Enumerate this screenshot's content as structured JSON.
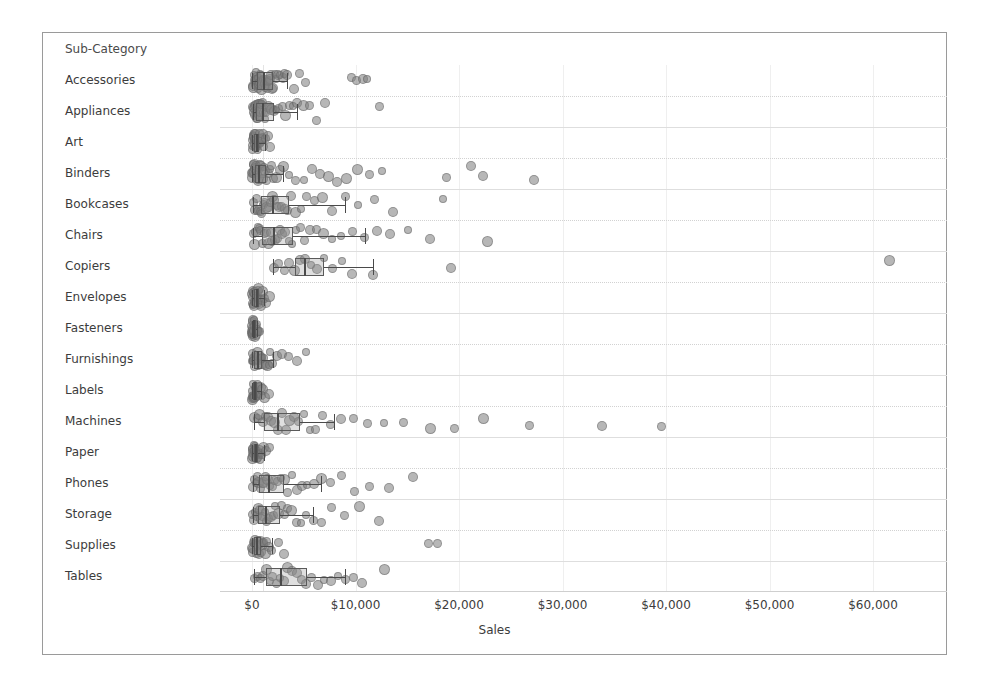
{
  "header": {
    "field_caption": "Sub-Category"
  },
  "axis": {
    "title": "Sales",
    "tick_labels": [
      "$0",
      "$10,000",
      "$20,000",
      "$30,000",
      "$40,000",
      "$50,000",
      "$60,000"
    ],
    "tick_values": [
      0,
      10000,
      20000,
      30000,
      40000,
      50000,
      60000
    ]
  },
  "style": {
    "mark_color": "#7c7c7c",
    "box_line_color": "#4a4a4a",
    "gridline_color": "#dedede",
    "border_color": "#9a9a9a",
    "text_color": "#3c3c3c"
  },
  "chart_data": {
    "type": "box",
    "title": "",
    "xlabel": "Sales",
    "ylabel": "Sub-Category",
    "xlim": [
      -2000,
      65000
    ],
    "grid": true,
    "legend": "none",
    "orientation": "horizontal",
    "categories": [
      "Accessories",
      "Appliances",
      "Art",
      "Binders",
      "Bookcases",
      "Chairs",
      "Copiers",
      "Envelopes",
      "Fasteners",
      "Furnishings",
      "Labels",
      "Machines",
      "Paper",
      "Phones",
      "Storage",
      "Supplies",
      "Tables"
    ],
    "series": [
      {
        "name": "Accessories",
        "min": 40,
        "q1": 480,
        "median": 1100,
        "q3": 2050,
        "max": 3400,
        "points": [
          120,
          180,
          220,
          260,
          300,
          340,
          380,
          420,
          470,
          520,
          560,
          600,
          650,
          700,
          760,
          820,
          880,
          940,
          1000,
          1080,
          1150,
          1220,
          1300,
          1380,
          1450,
          1550,
          1650,
          1750,
          1850,
          1950,
          2050,
          2200,
          2350,
          2500,
          2700,
          2950,
          3150,
          3400,
          4100,
          4600,
          5200,
          9600,
          10100,
          10700,
          11100
        ]
      },
      {
        "name": "Appliances",
        "min": 60,
        "q1": 420,
        "median": 1000,
        "q3": 2100,
        "max": 4300,
        "points": [
          90,
          150,
          200,
          250,
          300,
          350,
          400,
          450,
          520,
          580,
          640,
          700,
          780,
          860,
          940,
          1020,
          1120,
          1220,
          1340,
          1460,
          1600,
          1760,
          1900,
          2100,
          2350,
          2600,
          2900,
          3200,
          3600,
          4000,
          4300,
          5000,
          5600,
          6200,
          7100,
          12300
        ]
      },
      {
        "name": "Art",
        "min": 20,
        "q1": 190,
        "median": 380,
        "q3": 700,
        "max": 1300,
        "points": [
          30,
          55,
          80,
          110,
          140,
          170,
          200,
          230,
          260,
          300,
          340,
          380,
          420,
          460,
          510,
          560,
          620,
          680,
          740,
          810,
          890,
          970,
          1060,
          1150,
          1300,
          1500,
          1750
        ]
      },
      {
        "name": "Binders",
        "min": 30,
        "q1": 280,
        "median": 620,
        "q3": 1400,
        "max": 3000,
        "points": [
          40,
          80,
          130,
          180,
          230,
          280,
          330,
          390,
          450,
          510,
          580,
          650,
          720,
          800,
          880,
          970,
          1060,
          1160,
          1270,
          1400,
          1550,
          1700,
          1900,
          2100,
          2400,
          2700,
          3000,
          3600,
          4200,
          5000,
          5800,
          6600,
          7400,
          8200,
          9100,
          10200,
          11400,
          12600,
          18800,
          21200,
          22300,
          27200
        ]
      },
      {
        "name": "Bookcases",
        "min": 120,
        "q1": 900,
        "median": 1900,
        "q3": 3600,
        "max": 9000,
        "points": [
          150,
          280,
          400,
          520,
          650,
          790,
          930,
          1080,
          1230,
          1400,
          1570,
          1750,
          1950,
          2150,
          2380,
          2620,
          2880,
          3150,
          3450,
          3800,
          4200,
          4700,
          5300,
          6000,
          6800,
          7700,
          9000,
          10200,
          11800,
          13600,
          18500
        ]
      },
      {
        "name": "Chairs",
        "min": 100,
        "q1": 950,
        "median": 2000,
        "q3": 4000,
        "max": 10900,
        "points": [
          130,
          260,
          400,
          550,
          700,
          860,
          1020,
          1190,
          1370,
          1560,
          1760,
          1970,
          2190,
          2420,
          2670,
          2940,
          3230,
          3540,
          3880,
          4250,
          4660,
          5100,
          5600,
          6200,
          6900,
          7700,
          8600,
          9700,
          10900,
          12100,
          13300,
          15100,
          17200,
          22800
        ]
      },
      {
        "name": "Copiers",
        "min": 2000,
        "q1": 4200,
        "median": 5000,
        "q3": 7000,
        "max": 11700,
        "points": [
          2100,
          2600,
          3100,
          3600,
          4100,
          4600,
          5100,
          5700,
          6300,
          7000,
          7800,
          8700,
          9700,
          11700,
          19200,
          61600
        ]
      },
      {
        "name": "Envelopes",
        "min": 20,
        "q1": 170,
        "median": 340,
        "q3": 640,
        "max": 1200,
        "points": [
          25,
          50,
          80,
          110,
          140,
          175,
          210,
          250,
          290,
          330,
          375,
          420,
          470,
          520,
          580,
          640,
          710,
          780,
          860,
          950,
          1050,
          1200,
          1400,
          1650
        ]
      },
      {
        "name": "Fasteners",
        "min": 10,
        "q1": 60,
        "median": 130,
        "q3": 260,
        "max": 520,
        "points": [
          12,
          25,
          40,
          55,
          70,
          90,
          110,
          130,
          155,
          180,
          210,
          240,
          275,
          310,
          350,
          400,
          450,
          520,
          620,
          760
        ]
      },
      {
        "name": "Furnishings",
        "min": 20,
        "q1": 220,
        "median": 470,
        "q3": 950,
        "max": 2000,
        "points": [
          30,
          70,
          110,
          160,
          210,
          260,
          320,
          380,
          440,
          500,
          570,
          640,
          720,
          800,
          890,
          980,
          1080,
          1190,
          1310,
          1450,
          1600,
          1780,
          2000,
          2400,
          2900,
          3500,
          4300,
          5200
        ]
      },
      {
        "name": "Labels",
        "min": 10,
        "q1": 110,
        "median": 230,
        "q3": 450,
        "max": 900,
        "points": [
          15,
          35,
          55,
          80,
          105,
          130,
          160,
          190,
          225,
          260,
          300,
          345,
          390,
          440,
          500,
          560,
          630,
          710,
          800,
          900,
          1050,
          1250,
          1600
        ]
      },
      {
        "name": "Machines",
        "min": 200,
        "q1": 1200,
        "median": 2400,
        "q3": 4600,
        "max": 7900,
        "points": [
          250,
          500,
          760,
          1020,
          1300,
          1580,
          1880,
          2190,
          2520,
          2870,
          3240,
          3640,
          4070,
          4530,
          5030,
          5570,
          6170,
          6840,
          7600,
          8600,
          9800,
          11200,
          12800,
          14600,
          17200,
          19600,
          22400,
          26800,
          33800,
          39600
        ]
      },
      {
        "name": "Paper",
        "min": 15,
        "q1": 160,
        "median": 330,
        "q3": 610,
        "max": 1150,
        "points": [
          20,
          45,
          70,
          100,
          130,
          165,
          200,
          240,
          280,
          325,
          370,
          420,
          475,
          530,
          590,
          660,
          730,
          810,
          900,
          1000,
          1150,
          1350,
          1650
        ]
      },
      {
        "name": "Phones",
        "min": 80,
        "q1": 700,
        "median": 1500,
        "q3": 3100,
        "max": 6700,
        "points": [
          100,
          230,
          360,
          500,
          650,
          800,
          970,
          1140,
          1330,
          1530,
          1740,
          1970,
          2220,
          2490,
          2790,
          3110,
          3470,
          3860,
          4300,
          4800,
          5350,
          6000,
          6700,
          7600,
          8600,
          9900,
          11400,
          13200,
          15600
        ]
      },
      {
        "name": "Storage",
        "min": 60,
        "q1": 600,
        "median": 1300,
        "q3": 2700,
        "max": 5900,
        "points": [
          80,
          200,
          330,
          460,
          600,
          750,
          900,
          1060,
          1230,
          1410,
          1600,
          1810,
          2030,
          2270,
          2530,
          2810,
          3120,
          3460,
          3840,
          4260,
          4730,
          5260,
          5900,
          6700,
          7700,
          8900,
          10400,
          12300
        ]
      },
      {
        "name": "Supplies",
        "min": 20,
        "q1": 200,
        "median": 430,
        "q3": 900,
        "max": 1900,
        "points": [
          30,
          70,
          120,
          170,
          220,
          280,
          340,
          400,
          470,
          540,
          620,
          700,
          790,
          890,
          1000,
          1120,
          1260,
          1420,
          1600,
          1900,
          2600,
          3100,
          17100,
          17900
        ]
      },
      {
        "name": "Tables",
        "min": 200,
        "q1": 1400,
        "median": 2700,
        "q3": 5300,
        "max": 9000,
        "points": [
          250,
          520,
          800,
          1090,
          1390,
          1700,
          2020,
          2360,
          2710,
          3080,
          3470,
          3880,
          4310,
          4770,
          5260,
          5790,
          6360,
          6980,
          7650,
          8300,
          9000,
          9800,
          10600,
          12800
        ]
      }
    ]
  }
}
